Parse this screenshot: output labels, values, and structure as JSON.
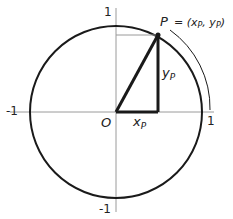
{
  "diagram": {
    "colors": {
      "stroke": "#1a1a1a",
      "axis": "#999999",
      "text": "#222222",
      "background": "#ffffff"
    },
    "axis_labels": {
      "x_pos": "1",
      "x_neg": "-1",
      "y_pos": "1",
      "y_neg": "-1"
    },
    "origin_label": "O",
    "point_label": "P",
    "point_coords": "= (x",
    "point_coords_full": "P = (xP, yP)",
    "xp_label": "x",
    "xp_sub": "P",
    "yp_label": "y",
    "yp_sub": "P",
    "coord_x": "x",
    "coord_y": "y",
    "coord_sub": "P",
    "comma": ",",
    "close_paren": ")"
  }
}
